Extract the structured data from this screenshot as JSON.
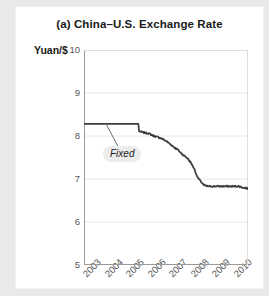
{
  "figure": {
    "title": "(a) China–U.S. Exchange Rate",
    "ylabel": "Yuan/$",
    "background_color": "#e9e9e9",
    "panel_color": "#ffffff"
  },
  "annotation": {
    "fixed_label": "Fixed"
  },
  "chart_data": {
    "type": "line",
    "title": "(a) China–U.S. Exchange Rate",
    "xlabel": "",
    "ylabel": "Yuan/$",
    "ylim": [
      5,
      10
    ],
    "xlim": [
      2003,
      2010.6
    ],
    "grid": true,
    "grid_axis": "y",
    "legend": "none",
    "line_color": "#3d3d3d",
    "yticks": [
      5,
      6,
      7,
      8,
      9,
      10
    ],
    "ytick_labels": [
      "5",
      "6",
      "7",
      "8",
      "9",
      "10"
    ],
    "xticks": [
      2003,
      2004,
      2005,
      2006,
      2007,
      2008,
      2009,
      2010
    ],
    "xtick_labels": [
      "2003",
      "2004",
      "2005",
      "2006",
      "2007",
      "2008",
      "2009",
      "2010"
    ],
    "annotations": [
      {
        "text": "Fixed",
        "x": 2004.7,
        "y": 7.45,
        "points_to_x": 2004.05,
        "points_to_y": 8.28
      }
    ],
    "series": [
      {
        "name": "Yuan per U.S. dollar",
        "x": [
          2003.0,
          2003.15,
          2003.3,
          2003.45,
          2003.6,
          2003.75,
          2003.9,
          2004.05,
          2004.2,
          2004.35,
          2004.5,
          2004.65,
          2004.8,
          2004.95,
          2005.1,
          2005.25,
          2005.4,
          2005.52,
          2005.55,
          2005.7,
          2005.85,
          2006.0,
          2006.15,
          2006.3,
          2006.45,
          2006.6,
          2006.75,
          2006.9,
          2007.05,
          2007.2,
          2007.35,
          2007.5,
          2007.65,
          2007.8,
          2007.95,
          2008.1,
          2008.25,
          2008.4,
          2008.55,
          2008.7,
          2008.85,
          2009.0,
          2009.15,
          2009.3,
          2009.45,
          2009.6,
          2009.75,
          2009.9,
          2010.05,
          2010.2,
          2010.35,
          2010.5,
          2010.6
        ],
        "y": [
          8.28,
          8.28,
          8.28,
          8.28,
          8.28,
          8.28,
          8.28,
          8.28,
          8.28,
          8.28,
          8.28,
          8.28,
          8.28,
          8.28,
          8.28,
          8.28,
          8.28,
          8.28,
          8.11,
          8.09,
          8.07,
          8.06,
          8.02,
          7.99,
          7.97,
          7.94,
          7.9,
          7.85,
          7.79,
          7.73,
          7.68,
          7.6,
          7.54,
          7.48,
          7.38,
          7.25,
          7.05,
          6.95,
          6.86,
          6.83,
          6.83,
          6.83,
          6.83,
          6.83,
          6.83,
          6.83,
          6.83,
          6.83,
          6.83,
          6.83,
          6.8,
          6.79,
          6.78
        ]
      }
    ]
  }
}
